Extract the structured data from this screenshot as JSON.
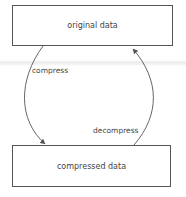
{
  "diagram": {
    "nodes": [
      {
        "id": "original",
        "label": "original data"
      },
      {
        "id": "compressed",
        "label": "compressed data"
      }
    ],
    "edges": [
      {
        "from": "original",
        "to": "compressed",
        "label": "compress"
      },
      {
        "from": "compressed",
        "to": "original",
        "label": "decompress"
      }
    ],
    "colors": {
      "stroke": "#555555",
      "text": "#444444"
    }
  }
}
